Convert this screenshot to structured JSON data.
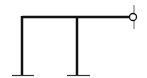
{
  "diagram": {
    "type": "structural-frame",
    "colors": {
      "member": "#111111",
      "ground": "#333333",
      "support_wall": "#9a9a9a",
      "pin_fill": "#ffffff",
      "background": "#ffffff"
    },
    "members": [
      {
        "id": "beam",
        "x1": 22,
        "y1": 17,
        "x2": 131,
        "y2": 17
      },
      {
        "id": "column-left",
        "x1": 22,
        "y1": 17,
        "x2": 22,
        "y2": 75
      },
      {
        "id": "column-middle",
        "x1": 77,
        "y1": 17,
        "x2": 77,
        "y2": 75
      }
    ],
    "supports": [
      {
        "id": "fixed-left",
        "type": "fixed",
        "x1": 12,
        "x2": 34,
        "y": 75
      },
      {
        "id": "fixed-middle",
        "type": "fixed",
        "x1": 67,
        "x2": 90,
        "y": 75
      },
      {
        "id": "pin-right",
        "type": "pin",
        "cx": 133,
        "cy": 17,
        "r": 3.5,
        "wall_x": 134,
        "wall_y1": 5,
        "wall_y2": 29
      }
    ]
  }
}
